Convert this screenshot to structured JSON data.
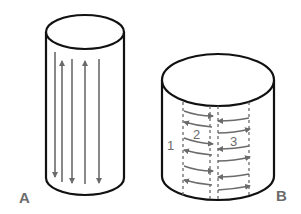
{
  "figure": {
    "panels": [
      {
        "id": "A",
        "label": "A",
        "description": "Tall cylinder with vertical longitudinal arrows alternating direction",
        "arrows": [
          {
            "x": 55,
            "direction": "down"
          },
          {
            "x": 62,
            "direction": "up"
          },
          {
            "x": 72,
            "direction": "down"
          },
          {
            "x": 85,
            "direction": "up"
          },
          {
            "x": 99,
            "direction": "down"
          }
        ]
      },
      {
        "id": "B",
        "label": "B",
        "description": "Short wide cylinder divided into dashed vertical zones with horizontal circumferential arrows",
        "zones": [
          {
            "label": "1"
          },
          {
            "label": "2"
          },
          {
            "label": "3"
          }
        ]
      }
    ],
    "colors": {
      "outline": "#111111",
      "arrow": "#6b6b6b",
      "label": "#6b6b6b"
    }
  }
}
